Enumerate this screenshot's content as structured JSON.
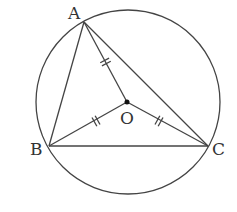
{
  "diagram": {
    "type": "circumscribed-triangle",
    "circle": {
      "cx": 128,
      "cy": 102,
      "r": 92
    },
    "points": {
      "A": {
        "label": "A",
        "x": 84,
        "y": 22
      },
      "B": {
        "label": "B",
        "x": 49,
        "y": 146
      },
      "C": {
        "label": "C",
        "x": 208,
        "y": 146
      },
      "O": {
        "label": "O",
        "x": 127,
        "y": 102
      }
    },
    "segments": [
      "AB",
      "BC",
      "CA",
      "OA",
      "OB",
      "OC"
    ],
    "equal_marks": [
      "OA",
      "OB",
      "OC"
    ],
    "stroke_color": "#444444"
  }
}
